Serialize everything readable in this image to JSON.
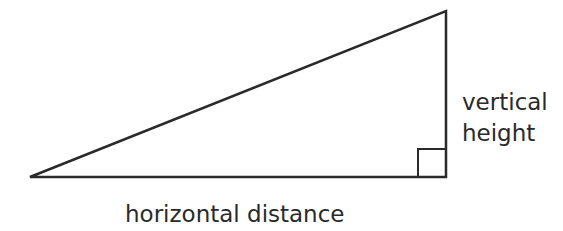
{
  "diagram": {
    "type": "right-triangle",
    "stroke_color": "#2a2a2a",
    "labels": {
      "vertical_line1": "vertical",
      "vertical_line2": "height",
      "horizontal": "horizontal distance"
    },
    "vertices": {
      "left": [
        30,
        177
      ],
      "top_right": [
        446,
        11
      ],
      "bottom_right": [
        446,
        177
      ]
    },
    "right_angle_marker": {
      "x": 418,
      "y": 149,
      "size": 28
    }
  }
}
